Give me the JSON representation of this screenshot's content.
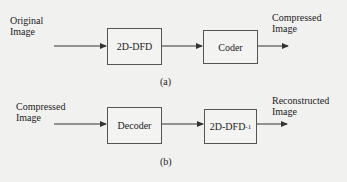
{
  "diagram_a": {
    "input_label_line1": "Original",
    "input_label_line2": "Image",
    "block1": "2D-DFD",
    "block2": "Coder",
    "output_label_line1": "Compressed",
    "output_label_line2": "Image",
    "caption": "(a)"
  },
  "diagram_b": {
    "input_label_line1": "Compressed",
    "input_label_line2": "Image",
    "block1": "Decoder",
    "block2": "2D-DFD",
    "block2_superscript": "-1",
    "output_label_line1": "Reconstructed",
    "output_label_line2": "Image",
    "caption": "(b)"
  },
  "colors": {
    "background": "#f1f1ef",
    "lines": "#333333"
  }
}
